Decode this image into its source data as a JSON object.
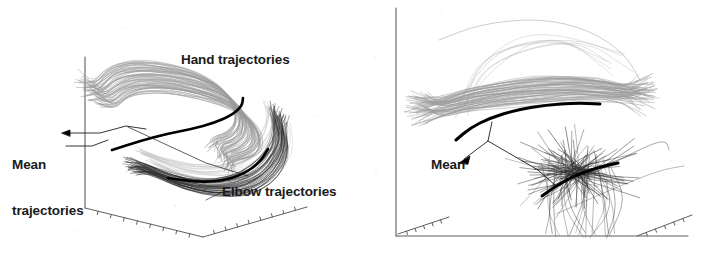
{
  "figure": {
    "background_color": "#ffffff",
    "width": 708,
    "height": 254,
    "panels": [
      {
        "id": "left-panel",
        "name": "left-panel",
        "view": "oblique-3d",
        "axes": {
          "type": "3d-corner",
          "vertical_axis": {
            "x": 85,
            "y_top": 57,
            "y_bottom": 208
          },
          "left_floor_edge": {
            "x1": 85,
            "y1": 208,
            "x2": 203,
            "y2": 237,
            "ticks": 8
          },
          "right_floor_edge": {
            "x1": 203,
            "y1": 237,
            "x2": 307,
            "y2": 207,
            "ticks": 8
          },
          "tick_labels": [],
          "grid": false,
          "color": "#555555"
        },
        "labels": [
          {
            "name": "hand-trajectories-label",
            "text": "Hand trajectories"
          },
          {
            "name": "mean-trajectories-label",
            "line1": "Mean",
            "line2": "trajectories"
          },
          {
            "name": "elbow-trajectories-label",
            "text": "Elbow trajectories"
          }
        ],
        "bundles": [
          {
            "name": "hand-trajectory-bundle",
            "color": "#9a9a9a",
            "count": 62,
            "description": "light gray hooked bundle of hand paths"
          },
          {
            "name": "elbow-trajectory-bundle",
            "color": "#2f2f2f",
            "count": 40,
            "description": "dark bundle of elbow paths along the lower right"
          },
          {
            "name": "hand-mean-trajectory",
            "color": "#000000",
            "description": "thick black mean hand trajectory"
          },
          {
            "name": "elbow-mean-trajectory",
            "color": "#000000",
            "description": "thick black mean elbow trajectory"
          }
        ]
      },
      {
        "id": "right-panel",
        "name": "right-panel",
        "view": "oblique-3d",
        "axes": {
          "type": "3d-corner",
          "vertical_axis": {
            "x": 396,
            "y_top": 8,
            "y_bottom": 236
          },
          "floor_baseline": {
            "x1": 396,
            "y1": 236,
            "x2": 688,
            "y2": 236
          },
          "left_depth_edge": {
            "x1": 398,
            "y1": 234,
            "x2": 449,
            "y2": 217,
            "ticks": 5
          },
          "right_depth_edge": {
            "x1": 637,
            "y1": 236,
            "x2": 692,
            "y2": 215,
            "ticks": 5
          },
          "tick_labels": [],
          "grid": false,
          "color": "#555555"
        },
        "labels": [
          {
            "name": "mean-label",
            "text": "Mean"
          }
        ],
        "bundles": [
          {
            "name": "hand-trajectory-bundle",
            "color": "#9a9a9a",
            "count": 58,
            "description": "light gray horizontal bundle of hand paths"
          },
          {
            "name": "elbow-trajectory-bundle",
            "color": "#2f2f2f",
            "count": 70,
            "description": "dark scattered bundle of elbow paths"
          },
          {
            "name": "hand-mean-trajectory",
            "color": "#000000",
            "description": "thick black mean hand trajectory"
          },
          {
            "name": "elbow-mean-trajectory",
            "color": "#000000",
            "description": "thick black mean elbow trajectory"
          }
        ]
      }
    ]
  },
  "labels": {
    "hand_trajectories": "Hand trajectories",
    "mean_trajectories_line1": "Mean",
    "mean_trajectories_line2": "trajectories",
    "elbow_trajectories": "Elbow trajectories",
    "mean": "Mean"
  },
  "colors": {
    "background": "#ffffff",
    "hand_bundle": "#9a9a9a",
    "elbow_bundle": "#2f2f2f",
    "mean_line": "#000000",
    "axis": "#555555",
    "text": "#1a1a1a"
  }
}
